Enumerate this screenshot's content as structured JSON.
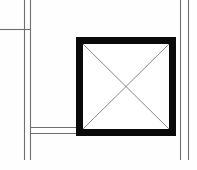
{
  "canvas": {
    "width": 197,
    "height": 170,
    "background_color": "#fefefe",
    "title": "Structural column plan detail"
  },
  "palette": {
    "column_fill": "#0a0a0a",
    "wall_line": "#6e6e6e",
    "wall_line_light": "#8a8a8a",
    "hatch_line": "#7a7a7a",
    "void_fill": "#ffffff"
  },
  "elements": {
    "column": {
      "label": "column",
      "x": 76,
      "y": 37,
      "width": 100,
      "height": 99,
      "border_thickness": 7,
      "fill": "#0a0a0a",
      "inner_fill": "#ffffff"
    },
    "hatch": {
      "label": "cross-hatch",
      "stroke": "#7a7a7a",
      "stroke_width": 0.9,
      "lines": [
        {
          "x1": 83,
          "y1": 44,
          "x2": 169,
          "y2": 129
        },
        {
          "x1": 169,
          "y1": 44,
          "x2": 83,
          "y2": 129
        }
      ]
    },
    "left_wall": {
      "label": "left vertical wall",
      "stroke": "#6e6e6e",
      "stroke_width": 1.1,
      "lines": [
        {
          "x1": 24.5,
          "y1": 0,
          "x2": 24.5,
          "y2": 160
        },
        {
          "x1": 30.5,
          "y1": 0,
          "x2": 30.5,
          "y2": 160
        }
      ]
    },
    "right_wall": {
      "label": "right vertical wall",
      "stroke": "#6e6e6e",
      "stroke_width": 1.1,
      "lines": [
        {
          "x1": 180.5,
          "y1": 0,
          "x2": 180.5,
          "y2": 160
        },
        {
          "x1": 188.5,
          "y1": 0,
          "x2": 188.5,
          "y2": 160
        }
      ]
    },
    "upper_wall": {
      "label": "upper horizontal wall stub",
      "stroke": "#6e6e6e",
      "stroke_width": 1.1,
      "lines": [
        {
          "x1": 0,
          "y1": 29.5,
          "x2": 30.5,
          "y2": 29.5
        }
      ]
    },
    "lower_wall": {
      "label": "lower horizontal wall",
      "stroke": "#6e6e6e",
      "stroke_width": 1.1,
      "lines": [
        {
          "x1": 30,
          "y1": 127.5,
          "x2": 76,
          "y2": 127.5
        },
        {
          "x1": 30,
          "y1": 133.5,
          "x2": 76,
          "y2": 133.5
        }
      ]
    }
  }
}
